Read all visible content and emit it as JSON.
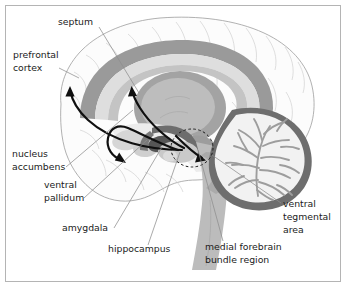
{
  "figure": {
    "type": "anatomical-diagram",
    "orientation": "left-facing midsagittal section",
    "border_color": "#b4b4b4",
    "background_color": "#ffffff"
  },
  "labels": {
    "septum": "septum",
    "prefrontal_cortex_line1": "prefrontal",
    "prefrontal_cortex_line2": "cortex",
    "nucleus_accumbens_line1": "nucleus",
    "nucleus_accumbens_line2": "accumbens",
    "ventral_pallidum_line1": "ventral",
    "ventral_pallidum_line2": "pallidum",
    "amygdala": "amygdala",
    "hippocampus": "hippocampus",
    "medial_forebrain_line1": "medial forebrain",
    "medial_forebrain_line2": "bundle region",
    "ventral_tegmental_line1": "ventral",
    "ventral_tegmental_line2": "tegmental",
    "ventral_tegmental_line3": "area"
  },
  "structures": [
    {
      "name": "cerebral-cortex",
      "fill": "#fbfbfb",
      "stroke": "#9d9d9d"
    },
    {
      "name": "cingulate-gyrus",
      "fill": "#9a9a9a"
    },
    {
      "name": "corpus-callosum",
      "fill": "#dedede"
    },
    {
      "name": "fornix-band",
      "fill": "#c4c4c4"
    },
    {
      "name": "thalamus",
      "fill": "#a8a8a8"
    },
    {
      "name": "thalamus-core",
      "fill": "#b8b8b8"
    },
    {
      "name": "cerebellum",
      "fill": "#efefef"
    },
    {
      "name": "cerebellum-arbor",
      "fill": "#a0a0a0"
    },
    {
      "name": "cerebellum-rim",
      "fill": "#6e6e6e"
    },
    {
      "name": "brainstem",
      "fill": "#b9b9b9"
    },
    {
      "name": "hippocampus-body",
      "fill": "#6a6a6a"
    },
    {
      "name": "amygdala-body",
      "fill": "#555555"
    },
    {
      "name": "nucleus-accumbens-body",
      "fill": "#d2d2d2"
    },
    {
      "name": "ventral-tegmental-circle",
      "stroke": "#1b1b1b",
      "style": "dashed"
    }
  ],
  "pathways": {
    "color": "#101010",
    "arrows": [
      {
        "name": "vta-to-prefrontal-cortex",
        "target": "prefrontal cortex"
      },
      {
        "name": "vta-to-septum",
        "target": "septum"
      },
      {
        "name": "vta-to-nucleus-accumbens",
        "target": "nucleus accumbens"
      },
      {
        "name": "vta-descending",
        "target": "ventral tegmental area"
      }
    ]
  },
  "leader_lines": {
    "color": "#8e8e8e",
    "width": 0.7
  }
}
